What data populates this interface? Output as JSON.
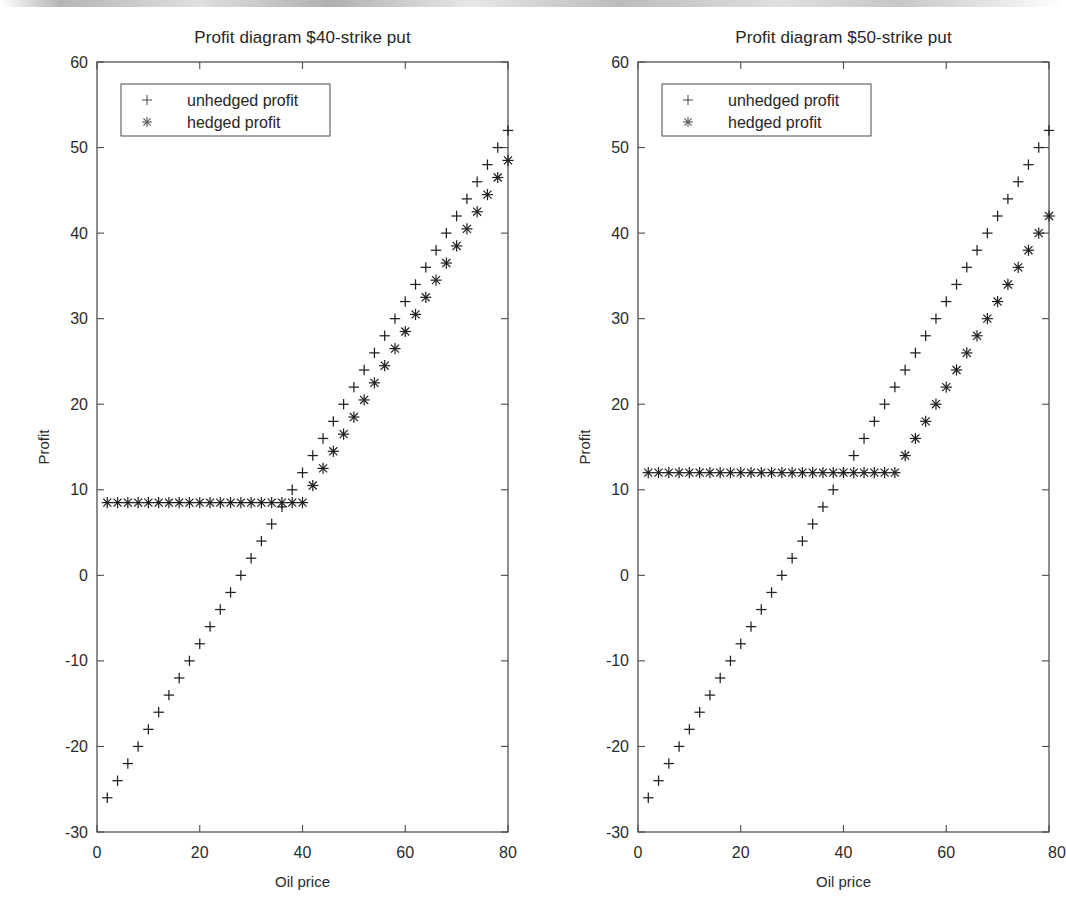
{
  "document": {
    "kind": "scanned-figure",
    "background_color": "#ffffff",
    "ink_color": "#1f1f1f"
  },
  "figure": {
    "panels": [
      "left",
      "right"
    ]
  },
  "chart_data": [
    {
      "panel": "left",
      "type": "scatter",
      "title": "Profit diagram $40-strike put",
      "xlabel": "Oil price",
      "ylabel": "Profit",
      "xlim": [
        0,
        80
      ],
      "ylim": [
        -30,
        60
      ],
      "xticks": [
        0,
        20,
        40,
        60,
        80
      ],
      "xtick_labels": [
        "0",
        "20",
        "40",
        "60",
        "80"
      ],
      "yticks": [
        -30,
        -20,
        -10,
        0,
        10,
        20,
        30,
        40,
        50,
        60
      ],
      "ytick_labels": [
        "-30",
        "-20",
        "-10",
        "0",
        "10",
        "20",
        "30",
        "40",
        "50",
        "60"
      ],
      "grid": false,
      "legend_position": "upper left",
      "legend": [
        "unhedged profit",
        "hedged profit"
      ],
      "strike": 40,
      "option_premium": 8.5,
      "series": [
        {
          "name": "unhedged profit",
          "marker": "+",
          "x": [
            2,
            4,
            6,
            8,
            10,
            12,
            14,
            16,
            18,
            20,
            22,
            24,
            26,
            28,
            30,
            32,
            34,
            36,
            38,
            40,
            42,
            44,
            46,
            48,
            50,
            52,
            54,
            56,
            58,
            60,
            62,
            64,
            66,
            68,
            70,
            72,
            74,
            76,
            78,
            80
          ],
          "values": [
            -26,
            -24,
            -22,
            -20,
            -18,
            -16,
            -14,
            -12,
            -10,
            -8,
            -6,
            -4,
            -2,
            0,
            2,
            4,
            6,
            8,
            10,
            12,
            14,
            16,
            18,
            20,
            22,
            24,
            26,
            28,
            30,
            32,
            34,
            36,
            38,
            40,
            42,
            44,
            46,
            48,
            50,
            52
          ]
        },
        {
          "name": "hedged profit",
          "marker": "*",
          "x": [
            2,
            4,
            6,
            8,
            10,
            12,
            14,
            16,
            18,
            20,
            22,
            24,
            26,
            28,
            30,
            32,
            34,
            36,
            38,
            40,
            42,
            44,
            46,
            48,
            50,
            52,
            54,
            56,
            58,
            60,
            62,
            64,
            66,
            68,
            70,
            72,
            74,
            76,
            78,
            80
          ],
          "values": [
            8.5,
            8.5,
            8.5,
            8.5,
            8.5,
            8.5,
            8.5,
            8.5,
            8.5,
            8.5,
            8.5,
            8.5,
            8.5,
            8.5,
            8.5,
            8.5,
            8.5,
            8.5,
            8.5,
            8.5,
            10.5,
            12.5,
            14.5,
            16.5,
            18.5,
            20.5,
            22.5,
            24.5,
            26.5,
            28.5,
            30.5,
            32.5,
            34.5,
            36.5,
            38.5,
            40.5,
            42.5,
            44.5,
            46.5,
            48.5
          ]
        }
      ]
    },
    {
      "panel": "right",
      "type": "scatter",
      "title": "Profit diagram $50-strike put",
      "xlabel": "Oil price",
      "ylabel": "Profit",
      "xlim": [
        0,
        80
      ],
      "ylim": [
        -30,
        60
      ],
      "xticks": [
        0,
        20,
        40,
        60,
        80
      ],
      "xtick_labels": [
        "0",
        "20",
        "40",
        "60",
        "80"
      ],
      "yticks": [
        -30,
        -20,
        -10,
        0,
        10,
        20,
        30,
        40,
        50,
        60
      ],
      "ytick_labels": [
        "-30",
        "-20",
        "-10",
        "0",
        "10",
        "20",
        "30",
        "40",
        "50",
        "60"
      ],
      "grid": false,
      "legend_position": "upper left",
      "legend": [
        "unhedged profit",
        "hedged profit"
      ],
      "strike": 50,
      "option_premium": 12,
      "series": [
        {
          "name": "unhedged profit",
          "marker": "+",
          "x": [
            2,
            4,
            6,
            8,
            10,
            12,
            14,
            16,
            18,
            20,
            22,
            24,
            26,
            28,
            30,
            32,
            34,
            36,
            38,
            40,
            42,
            44,
            46,
            48,
            50,
            52,
            54,
            56,
            58,
            60,
            62,
            64,
            66,
            68,
            70,
            72,
            74,
            76,
            78,
            80
          ],
          "values": [
            -26,
            -24,
            -22,
            -20,
            -18,
            -16,
            -14,
            -12,
            -10,
            -8,
            -6,
            -4,
            -2,
            0,
            2,
            4,
            6,
            8,
            10,
            12,
            14,
            16,
            18,
            20,
            22,
            24,
            26,
            28,
            30,
            32,
            34,
            36,
            38,
            40,
            42,
            44,
            46,
            48,
            50,
            52
          ]
        },
        {
          "name": "hedged profit",
          "marker": "*",
          "x": [
            2,
            4,
            6,
            8,
            10,
            12,
            14,
            16,
            18,
            20,
            22,
            24,
            26,
            28,
            30,
            32,
            34,
            36,
            38,
            40,
            42,
            44,
            46,
            48,
            50,
            52,
            54,
            56,
            58,
            60,
            62,
            64,
            66,
            68,
            70,
            72,
            74,
            76,
            78,
            80
          ],
          "values": [
            12,
            12,
            12,
            12,
            12,
            12,
            12,
            12,
            12,
            12,
            12,
            12,
            12,
            12,
            12,
            12,
            12,
            12,
            12,
            12,
            12,
            12,
            12,
            12,
            12,
            14,
            16,
            18,
            20,
            22,
            24,
            26,
            28,
            30,
            32,
            34,
            36,
            38,
            40,
            42
          ]
        }
      ]
    }
  ]
}
